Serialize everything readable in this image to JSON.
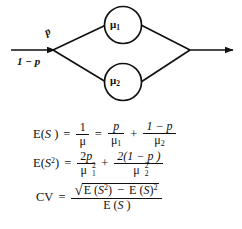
{
  "diagram": {
    "name": "hyperexponential-two-phase-branching-diagram",
    "entry_arrow": "input-arrow",
    "exit_arrow": "output-arrow",
    "nodes": [
      {
        "id": "mu1",
        "symbol": "μ",
        "subscript": "1"
      },
      {
        "id": "mu2",
        "symbol": "μ",
        "subscript": "2"
      }
    ],
    "branch_labels": {
      "upper": "p",
      "lower": "1 − p"
    },
    "stroke_color": "#111111"
  },
  "equations": {
    "line1": {
      "lhs_prefix": "E(",
      "lhs_var": "S",
      "lhs_suffix": " )",
      "eq1": "=",
      "frac1": {
        "num": "1",
        "den_mu": "μ",
        "den_sub": ""
      },
      "eq2": "=",
      "frac2": {
        "num": "p",
        "den_mu": "μ",
        "den_sub": "1"
      },
      "plus": "+",
      "frac3": {
        "num": "1 − p",
        "den_mu": "μ",
        "den_sub": "2"
      }
    },
    "line2": {
      "lhs_prefix": "E(",
      "lhs_var": "S",
      "lhs_sup": "2",
      "lhs_suffix": ")",
      "eq": "=",
      "frac1": {
        "num_coef": "2",
        "num_var": "p",
        "den_mu": "μ",
        "den_sub": "1",
        "den_sup": "2"
      },
      "plus": "+",
      "frac2": {
        "num": "2(1 − p )",
        "den_mu": "μ",
        "den_sub": "2",
        "den_sup": "2"
      }
    },
    "line3": {
      "lhs": "CV",
      "eq": "=",
      "numerator": {
        "radical_sign": "√",
        "term1_prefix": "E (",
        "term1_var": "S",
        "term1_sup": "2",
        "term1_suffix": ")",
        "minus": "−",
        "term2_prefix": "E (",
        "term2_var": "S",
        "term2_suffix": ")",
        "term2_sup": "2"
      },
      "denominator": {
        "prefix": "E (",
        "var": "S",
        "suffix": " )"
      }
    }
  }
}
